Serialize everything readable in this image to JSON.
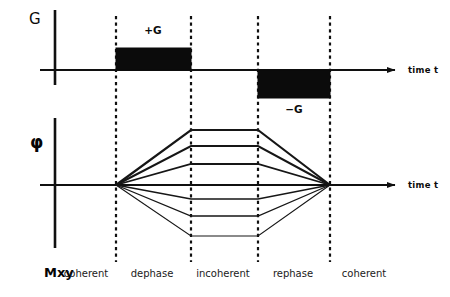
{
  "figure": {
    "background_color": "#ffffff",
    "ink_color": "#101010"
  },
  "gradient_axis": {
    "name": "gradient-axis",
    "vertical_label": "G",
    "time_label": "time t",
    "baseline_y": 70,
    "axis_x": 55,
    "arrow_tip_x": 395
  },
  "phase_axis": {
    "name": "phase-axis",
    "vertical_label": "φ",
    "time_label": "time t",
    "baseline_y": 185,
    "axis_x": 55,
    "arrow_tip_x": 395
  },
  "gradient_blocks": [
    {
      "id": "positive-gradient",
      "label": "+G",
      "polarity": "positive",
      "x_start": 116,
      "x_end": 191,
      "label_x": 153,
      "label_y": 34,
      "top_y": 48,
      "bottom_y": 70,
      "fill": "#0b0b0b"
    },
    {
      "id": "negative-gradient",
      "label": "−G",
      "polarity": "negative",
      "x_start": 258,
      "x_end": 330,
      "label_x": 294,
      "label_y": 113,
      "top_y": 70,
      "bottom_y": 98,
      "fill": "#0b0b0b"
    }
  ],
  "dividers": [
    {
      "id": "divider-1",
      "x": 116,
      "y_top": 16,
      "y_bottom": 262
    },
    {
      "id": "divider-2",
      "x": 191,
      "y_top": 16,
      "y_bottom": 262
    },
    {
      "id": "divider-3",
      "x": 258,
      "y_top": 16,
      "y_bottom": 262
    },
    {
      "id": "divider-4",
      "x": 330,
      "y_top": 16,
      "y_bottom": 262
    }
  ],
  "phase_fan": {
    "dephase_origin_x": 116,
    "plateau_start_x": 191,
    "plateau_end_x": 258,
    "rephase_focus_x": 330,
    "origin_y": 185,
    "isochromats": [
      {
        "id": "isochromat-1",
        "plateau_y": 130,
        "stroke_width": 2.2
      },
      {
        "id": "isochromat-2",
        "plateau_y": 146,
        "stroke_width": 2.0
      },
      {
        "id": "isochromat-3",
        "plateau_y": 164,
        "stroke_width": 1.8
      },
      {
        "id": "isochromat-4",
        "plateau_y": 199,
        "stroke_width": 1.5
      },
      {
        "id": "isochromat-5",
        "plateau_y": 216,
        "stroke_width": 1.3
      },
      {
        "id": "isochromat-6",
        "plateau_y": 236,
        "stroke_width": 1.1
      }
    ]
  },
  "bottom_labels": {
    "magnetization": "Mxy",
    "magnetization_x": 44,
    "phases": [
      {
        "id": "phase-coherent-1",
        "text": "coherent",
        "x": 86
      },
      {
        "id": "phase-dephase",
        "text": "dephase",
        "x": 152
      },
      {
        "id": "phase-incoherent",
        "text": "incoherent",
        "x": 223
      },
      {
        "id": "phase-rephase",
        "text": "rephase",
        "x": 293
      },
      {
        "id": "phase-coherent-2",
        "text": "coherent",
        "x": 364
      }
    ],
    "row_y": 277
  }
}
